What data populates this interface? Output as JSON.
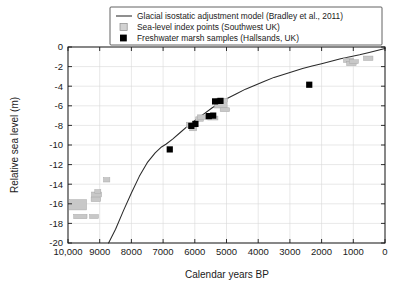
{
  "chart_data": {
    "type": "scatter",
    "title": "",
    "xlabel": "Calendar years BP",
    "ylabel": "Relative sea level (m)",
    "xlim": [
      10000,
      0
    ],
    "ylim": [
      -20,
      0
    ],
    "x_inverted": true,
    "grid": true,
    "legend_position": "top-center",
    "xticks": [
      10000,
      9000,
      8000,
      7000,
      6000,
      5000,
      4000,
      3000,
      2000,
      1000,
      0
    ],
    "xticklabels": [
      "10,000",
      "9000",
      "8000",
      "7000",
      "6000",
      "5000",
      "4000",
      "3000",
      "2000",
      "1000",
      "0"
    ],
    "yticks": [
      0,
      -2,
      -4,
      -6,
      -8,
      -10,
      -12,
      -14,
      -16,
      -18,
      -20
    ],
    "yticklabels": [
      "0",
      "-2",
      "-4",
      "-6",
      "-8",
      "-10",
      "-12",
      "-14",
      "-16",
      "-18",
      "-20"
    ],
    "series": [
      {
        "name": "Glacial isostatic adjustment model (Bradley et al., 2011)",
        "type": "line",
        "color": "#2a2a2a",
        "points": [
          [
            8720,
            -20.0
          ],
          [
            8500,
            -18.6
          ],
          [
            8250,
            -16.7
          ],
          [
            8000,
            -14.9
          ],
          [
            7750,
            -13.2
          ],
          [
            7500,
            -11.8
          ],
          [
            7250,
            -10.8
          ],
          [
            7050,
            -10.2
          ],
          [
            6900,
            -9.9
          ],
          [
            6700,
            -9.4
          ],
          [
            6450,
            -8.7
          ],
          [
            6200,
            -8.0
          ],
          [
            5950,
            -7.4
          ],
          [
            5700,
            -6.8
          ],
          [
            5450,
            -6.2
          ],
          [
            5200,
            -5.7
          ],
          [
            4950,
            -5.2
          ],
          [
            4700,
            -4.8
          ],
          [
            4400,
            -4.3
          ],
          [
            4100,
            -3.9
          ],
          [
            3800,
            -3.5
          ],
          [
            3500,
            -3.1
          ],
          [
            3200,
            -2.8
          ],
          [
            2900,
            -2.5
          ],
          [
            2600,
            -2.2
          ],
          [
            2300,
            -1.95
          ],
          [
            2000,
            -1.7
          ],
          [
            1700,
            -1.45
          ],
          [
            1400,
            -1.2
          ],
          [
            1100,
            -1.0
          ],
          [
            800,
            -0.8
          ],
          [
            500,
            -0.55
          ],
          [
            250,
            -0.35
          ],
          [
            0,
            -0.15
          ]
        ]
      },
      {
        "name": "Sea-level index points (Southwest UK)",
        "type": "box",
        "color": "#c8c8c8",
        "boxes": [
          {
            "x": 9680,
            "y": -16.1,
            "w": 530,
            "h": 1.05
          },
          {
            "x": 9610,
            "y": -17.3,
            "w": 420,
            "h": 0.45
          },
          {
            "x": 9180,
            "y": -17.3,
            "w": 280,
            "h": 0.4
          },
          {
            "x": 9100,
            "y": -15.05,
            "w": 320,
            "h": 0.5
          },
          {
            "x": 9120,
            "y": -15.55,
            "w": 300,
            "h": 0.45
          },
          {
            "x": 9060,
            "y": -14.75,
            "w": 190,
            "h": 0.4
          },
          {
            "x": 8780,
            "y": -13.55,
            "w": 200,
            "h": 0.45
          },
          {
            "x": 6120,
            "y": -7.95,
            "w": 290,
            "h": 0.55
          },
          {
            "x": 6050,
            "y": -8.35,
            "w": 220,
            "h": 0.4
          },
          {
            "x": 5850,
            "y": -7.35,
            "w": 240,
            "h": 0.45
          },
          {
            "x": 5700,
            "y": -7.15,
            "w": 430,
            "h": 0.45
          },
          {
            "x": 5430,
            "y": -7.25,
            "w": 320,
            "h": 0.4
          },
          {
            "x": 5180,
            "y": -6.0,
            "w": 400,
            "h": 0.45
          },
          {
            "x": 5150,
            "y": -5.45,
            "w": 370,
            "h": 0.45
          },
          {
            "x": 5050,
            "y": -6.4,
            "w": 300,
            "h": 0.4
          },
          {
            "x": 1150,
            "y": -1.35,
            "w": 320,
            "h": 0.45
          },
          {
            "x": 1060,
            "y": -1.7,
            "w": 300,
            "h": 0.4
          },
          {
            "x": 980,
            "y": -1.5,
            "w": 280,
            "h": 0.4
          },
          {
            "x": 530,
            "y": -1.15,
            "w": 300,
            "h": 0.45
          }
        ]
      },
      {
        "name": "Freshwater marsh samples (Hallsands, UK)",
        "type": "marker",
        "color": "#000000",
        "points": [
          [
            6790,
            -10.45
          ],
          [
            6110,
            -8.05
          ],
          [
            5980,
            -7.85
          ],
          [
            5560,
            -7.05
          ],
          [
            5420,
            -7.0
          ],
          [
            5190,
            -5.5
          ],
          [
            5360,
            -5.55
          ],
          [
            2390,
            -3.85
          ]
        ]
      }
    ],
    "legend": [
      {
        "key": "line",
        "label": "Glacial isostatic adjustment model (Bradley et al., 2011)"
      },
      {
        "key": "box",
        "label": "Sea-level index points (Southwest UK)"
      },
      {
        "key": "marker",
        "label": "Freshwater marsh samples (Hallsands, UK)"
      }
    ]
  }
}
